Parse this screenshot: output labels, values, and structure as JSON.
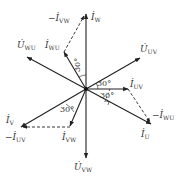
{
  "diagram": {
    "type": "phasor-diagram",
    "center": [
      86,
      89
    ],
    "colors": {
      "line": "#222222",
      "text": "#333333",
      "background": "#ffffff"
    },
    "phasors": [
      {
        "id": "I_W",
        "label": "İ",
        "sub": "W",
        "from": [
          86,
          89
        ],
        "to": [
          86,
          14
        ],
        "style": "solid"
      },
      {
        "id": "U_UV",
        "label": "U̇",
        "sub": "UV",
        "from": [
          86,
          89
        ],
        "to": [
          140,
          58
        ],
        "style": "solid"
      },
      {
        "id": "U_WU",
        "label": "U̇",
        "sub": "WU",
        "from": [
          86,
          89
        ],
        "to": [
          27,
          57
        ],
        "style": "solid"
      },
      {
        "id": "U_VW",
        "label": "U̇",
        "sub": "VW",
        "from": [
          86,
          89
        ],
        "to": [
          86,
          158
        ],
        "style": "solid"
      },
      {
        "id": "I_WU",
        "label": "İ",
        "sub": "WU",
        "from": [
          86,
          89
        ],
        "to": [
          64,
          52
        ],
        "style": "solid"
      },
      {
        "id": "-I_VW",
        "label": "−İ",
        "sub": "VW",
        "from": [
          64,
          52
        ],
        "to": [
          84,
          16
        ],
        "style": "dashed"
      },
      {
        "id": "I_UV",
        "label": "İ",
        "sub": "UV",
        "from": [
          86,
          89
        ],
        "to": [
          128,
          89
        ],
        "style": "solid"
      },
      {
        "id": "I_U",
        "label": "İ",
        "sub": "U",
        "from": [
          86,
          89
        ],
        "to": [
          151,
          124
        ],
        "style": "solid"
      },
      {
        "id": "-I_WU",
        "label": "−İ",
        "sub": "WU",
        "from": [
          128,
          89
        ],
        "to": [
          150,
          122
        ],
        "style": "dashed"
      },
      {
        "id": "I_V",
        "label": "İ",
        "sub": "V",
        "from": [
          86,
          89
        ],
        "to": [
          21,
          127
        ],
        "style": "solid"
      },
      {
        "id": "I_VW",
        "label": "İ",
        "sub": "VW",
        "from": [
          86,
          89
        ],
        "to": [
          70,
          126
        ],
        "style": "solid"
      },
      {
        "id": "-I_UV",
        "label": "−İ",
        "sub": "UV",
        "from": [
          70,
          127
        ],
        "to": [
          23,
          127
        ],
        "style": "dashed"
      }
    ],
    "labels": {
      "neg_i_vw": {
        "main": "−İ",
        "sub": "VW"
      },
      "i_w": {
        "main": "İ",
        "sub": "W"
      },
      "u_wu": {
        "main": "U̇",
        "sub": "WU"
      },
      "i_wu": {
        "main": "İ",
        "sub": "WU"
      },
      "u_uv": {
        "main": "U̇",
        "sub": "UV"
      },
      "i_uv": {
        "main": "İ",
        "sub": "UV"
      },
      "i_v": {
        "main": "İ",
        "sub": "V"
      },
      "neg_i_uv": {
        "main": "−İ",
        "sub": "UV"
      },
      "i_vw": {
        "main": "İ",
        "sub": "VW"
      },
      "neg_i_wu": {
        "main": "−İ",
        "sub": "WU"
      },
      "i_u": {
        "main": "İ",
        "sub": "U"
      },
      "u_vw": {
        "main": "U̇",
        "sub": "VW"
      }
    },
    "angles": {
      "top": "30°",
      "right_upper": "30°",
      "right_lower": "30°",
      "left_lower": "30°"
    }
  }
}
